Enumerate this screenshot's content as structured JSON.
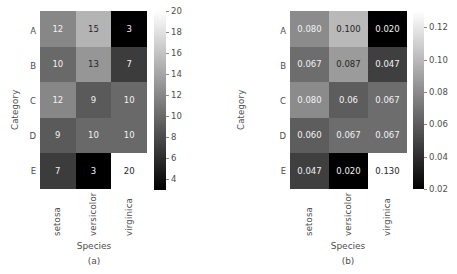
{
  "figure": {
    "width": 457,
    "height": 274,
    "background": "#ffffff",
    "text_color": "#4d4d4d"
  },
  "chart_data": [
    {
      "type": "heatmap",
      "panel": "a",
      "caption": "(a)",
      "title": "",
      "xlabel": "Species",
      "ylabel": "Category",
      "xticklabels": [
        "setosa",
        "versicolor",
        "virginica"
      ],
      "yticklabels": [
        "A",
        "B",
        "C",
        "D",
        "E"
      ],
      "annotate": true,
      "grid": false,
      "colormap": "gray",
      "clim": [
        3,
        20
      ],
      "colorbar": {
        "position": "right",
        "ticks": [
          20,
          18,
          16,
          14,
          12,
          10,
          8,
          6,
          4
        ],
        "ticklabels": [
          "20",
          "18",
          "16",
          "14",
          "12",
          "10",
          "8",
          "6",
          "4"
        ],
        "vmin": 3,
        "vmax": 20
      },
      "rows": [
        {
          "label": "A",
          "values": [
            12,
            15,
            3
          ],
          "display": [
            "12",
            "15",
            "3"
          ]
        },
        {
          "label": "B",
          "values": [
            10,
            13,
            7
          ],
          "display": [
            "10",
            "13",
            "7"
          ]
        },
        {
          "label": "C",
          "values": [
            12,
            9,
            10
          ],
          "display": [
            "12",
            "9",
            "10"
          ]
        },
        {
          "label": "D",
          "values": [
            9,
            10,
            10
          ],
          "display": [
            "9",
            "10",
            "10"
          ]
        },
        {
          "label": "E",
          "values": [
            7,
            3,
            20
          ],
          "display": [
            "7",
            "3",
            "20"
          ]
        }
      ]
    },
    {
      "type": "heatmap",
      "panel": "b",
      "caption": "(b)",
      "title": "",
      "xlabel": "Species",
      "ylabel": "Category",
      "xticklabels": [
        "setosa",
        "versicolor",
        "virginica"
      ],
      "yticklabels": [
        "A",
        "B",
        "C",
        "D",
        "E"
      ],
      "annotate": true,
      "grid": false,
      "colormap": "gray",
      "clim": [
        0.02,
        0.13
      ],
      "colorbar": {
        "position": "right",
        "ticks": [
          0.12,
          0.1,
          0.08,
          0.06,
          0.04,
          0.02
        ],
        "ticklabels": [
          "0.12",
          "0.10",
          "0.08",
          "0.06",
          "0.04",
          "0.02"
        ],
        "vmin": 0.02,
        "vmax": 0.13
      },
      "rows": [
        {
          "label": "A",
          "values": [
            0.08,
            0.1,
            0.02
          ],
          "display": [
            "0.080",
            "0.100",
            "0.020"
          ]
        },
        {
          "label": "B",
          "values": [
            0.067,
            0.087,
            0.047
          ],
          "display": [
            "0.067",
            "0.087",
            "0.047"
          ]
        },
        {
          "label": "C",
          "values": [
            0.08,
            0.06,
            0.067
          ],
          "display": [
            "0.080",
            "0.06",
            "0.067"
          ]
        },
        {
          "label": "D",
          "values": [
            0.06,
            0.067,
            0.067
          ],
          "display": [
            "0.060",
            "0.067",
            "0.067"
          ]
        },
        {
          "label": "E",
          "values": [
            0.047,
            0.02,
            0.13
          ],
          "display": [
            "0.047",
            "0.020",
            "0.130"
          ]
        }
      ]
    }
  ]
}
